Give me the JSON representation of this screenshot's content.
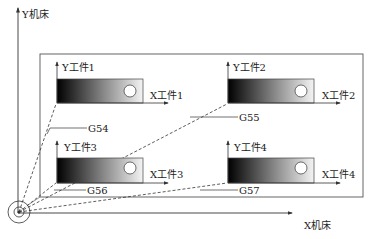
{
  "machine": {
    "y_axis_label": "Y机床",
    "x_axis_label": "X机床"
  },
  "workpieces": [
    {
      "id": 1,
      "y_label": "Y工件1",
      "x_label": "X工件1",
      "offset_code": "G54"
    },
    {
      "id": 2,
      "y_label": "Y工件2",
      "x_label": "X工件2",
      "offset_code": "G55"
    },
    {
      "id": 3,
      "y_label": "Y工件3",
      "x_label": "X工件3",
      "offset_code": "G56"
    },
    {
      "id": 4,
      "y_label": "Y工件4",
      "x_label": "X工件4",
      "offset_code": "G57"
    }
  ],
  "colors": {
    "line": "#333333",
    "gradient_dark": "#000000",
    "gradient_light": "#f4f4f4"
  }
}
